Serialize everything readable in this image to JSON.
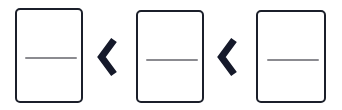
{
  "diagram": {
    "title": "",
    "background_color": "#ffffff",
    "canvas": {
      "width": 342,
      "height": 110
    },
    "style": {
      "card_border_color": "#1b1f2a",
      "card_fill_color": "#ffffff",
      "card_border_width": 2,
      "card_corner_radius": 5,
      "divider_line_color": "#8b8b90",
      "divider_line_thickness": 2,
      "chevron_color": "#15192a",
      "chevron_stroke_width": 7
    },
    "nodes": [
      {
        "id": "card-1",
        "type": "card",
        "label": "",
        "order": 1,
        "x": 15,
        "y": 8,
        "width": 68,
        "height": 95,
        "divider": {
          "x": 8,
          "y": 47,
          "length": 52
        }
      },
      {
        "id": "card-2",
        "type": "card",
        "label": "",
        "order": 2,
        "x": 136,
        "y": 10,
        "width": 68,
        "height": 93,
        "divider": {
          "x": 8,
          "y": 47,
          "length": 52
        }
      },
      {
        "id": "card-3",
        "type": "card",
        "label": "",
        "order": 3,
        "x": 256,
        "y": 10,
        "width": 70,
        "height": 93,
        "divider": {
          "x": 9,
          "y": 47,
          "length": 52
        }
      }
    ],
    "connectors": [
      {
        "id": "chevron-1",
        "icon": "chevron-left-icon",
        "label": "",
        "direction": "left",
        "from": "card-2",
        "to": "card-1",
        "x": 97,
        "y": 37,
        "width": 21,
        "height": 40
      },
      {
        "id": "chevron-2",
        "icon": "chevron-left-icon",
        "label": "",
        "direction": "left",
        "from": "card-3",
        "to": "card-2",
        "x": 217,
        "y": 37,
        "width": 21,
        "height": 40
      }
    ]
  }
}
